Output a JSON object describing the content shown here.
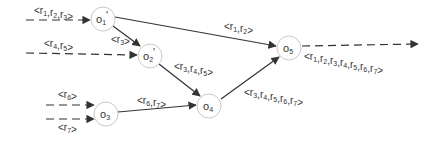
{
  "diagram": {
    "title": "",
    "colors": {
      "line": "#333333",
      "node_stroke": "#c8c8c8",
      "text": "#333333"
    },
    "nodes": [
      {
        "id": "o1p",
        "base": "o",
        "sub": "1",
        "prime": "'",
        "cx": 103,
        "cy": 19
      },
      {
        "id": "o2p",
        "base": "o",
        "sub": "2",
        "prime": "'",
        "cx": 150,
        "cy": 56
      },
      {
        "id": "o3",
        "base": "o",
        "sub": "3",
        "prime": "",
        "cx": 106,
        "cy": 114
      },
      {
        "id": "o4",
        "base": "o",
        "sub": "4",
        "prime": "",
        "cx": 209,
        "cy": 106
      },
      {
        "id": "o5",
        "base": "o",
        "sub": "5",
        "prime": "",
        "cx": 289,
        "cy": 48
      }
    ],
    "edges": [
      {
        "id": "in-o1p",
        "from": "input",
        "to": "o1p",
        "style": "dashed",
        "label": {
          "items": [
            "1",
            "2",
            "3"
          ]
        }
      },
      {
        "id": "in-o2p",
        "from": "input",
        "to": "o2p",
        "style": "dashed",
        "label": {
          "items": [
            "4",
            "5"
          ]
        }
      },
      {
        "id": "o1p-o2p",
        "from": "o1p",
        "to": "o2p",
        "style": "solid",
        "label": {
          "items": [
            "3"
          ]
        }
      },
      {
        "id": "o1p-o5",
        "from": "o1p",
        "to": "o5",
        "style": "solid",
        "label": {
          "items": [
            "1",
            "2"
          ]
        }
      },
      {
        "id": "o2p-o4",
        "from": "o2p",
        "to": "o4",
        "style": "solid",
        "label": {
          "items": [
            "3",
            "4",
            "5"
          ]
        }
      },
      {
        "id": "in6-o3",
        "from": "input",
        "to": "o3",
        "style": "dashed",
        "label": {
          "items": [
            "6"
          ]
        }
      },
      {
        "id": "in7-o3",
        "from": "input",
        "to": "o3",
        "style": "dashed",
        "label": {
          "items": [
            "7"
          ]
        }
      },
      {
        "id": "o3-o4",
        "from": "o3",
        "to": "o4",
        "style": "solid",
        "label": {
          "items": [
            "6",
            "7"
          ]
        }
      },
      {
        "id": "o4-o5",
        "from": "o4",
        "to": "o5",
        "style": "solid",
        "label": {
          "items": [
            "3",
            "4",
            "5",
            "6",
            "7"
          ]
        }
      },
      {
        "id": "o5-out",
        "from": "o5",
        "to": "output",
        "style": "dashed",
        "label": {
          "items": [
            "1",
            "2",
            "3",
            "4",
            "5",
            "6",
            "7"
          ]
        }
      }
    ],
    "labels": {
      "in_o1p": "<r1,r2,r3>",
      "in_o2p": "<r4,r5>",
      "o1p_o2p": "<r3>",
      "o1p_o5": "<r1,r2>",
      "o2p_o4": "<r3,r4,r5>",
      "in6_o3": "<r6>",
      "in7_o3": "<r7>",
      "o3_o4": "<r6,r7>",
      "o4_o5": "<r3,r4,r5,r6,r7>",
      "o5_out": "<r1,r2,r3,r4,r5,r6,r7>"
    }
  }
}
